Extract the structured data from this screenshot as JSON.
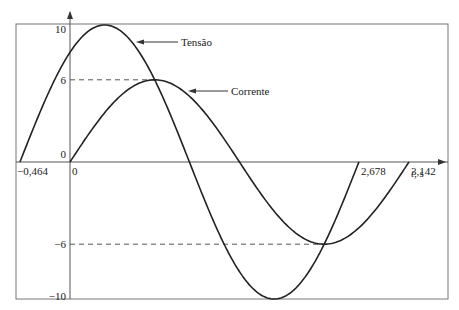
{
  "chart_data": {
    "type": "line",
    "title": "",
    "xlabel": "t, s",
    "ylabel": "",
    "xlim": [
      -0.464,
      3.142
    ],
    "ylim": [
      -10,
      10
    ],
    "series": [
      {
        "name": "Tensão",
        "amplitude": 10,
        "phase_shift": 0.464,
        "formula": "10 sin(2(t+0.464))",
        "x_start": -0.464,
        "x_end": 2.678
      },
      {
        "name": "Corrente",
        "amplitude": 6,
        "phase_shift": 0,
        "formula": "6 sin(2t)",
        "x_start": 0,
        "x_end": 3.142
      }
    ],
    "y_ticks": [
      {
        "value": 10,
        "label": "10"
      },
      {
        "value": 6,
        "label": "6"
      },
      {
        "value": 0,
        "label": "0"
      },
      {
        "value": -6,
        "label": "−6"
      },
      {
        "value": -10,
        "label": "−10"
      }
    ],
    "x_ticks": [
      {
        "value": -0.464,
        "label": "−0,464"
      },
      {
        "value": 0,
        "label": "0"
      },
      {
        "value": 2.678,
        "label": "2,678"
      },
      {
        "value": 3.142,
        "label": "3,142"
      }
    ],
    "dashed_guides": [
      6,
      -6
    ],
    "annotations": [
      {
        "text": "Tensão",
        "series": "Tensão"
      },
      {
        "text": "Corrente",
        "series": "Corrente"
      }
    ]
  }
}
